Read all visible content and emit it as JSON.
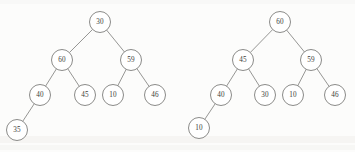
{
  "figure": {
    "node_radius": 10.5,
    "colors": {
      "background": "#fcfcfb",
      "node_fill": "#ffffff",
      "node_stroke": "#7e7e7c",
      "edge_stroke": "#8a8a88",
      "label_text": "#3a3a39"
    }
  },
  "trees": [
    {
      "name": "left-tree",
      "root_label": "30",
      "nodes": [
        {
          "id": "l0",
          "label": "30",
          "cx": 100,
          "cy": 22
        },
        {
          "id": "l1",
          "label": "60",
          "cx": 62,
          "cy": 60
        },
        {
          "id": "l2",
          "label": "59",
          "cx": 131,
          "cy": 60
        },
        {
          "id": "l3",
          "label": "40",
          "cx": 40,
          "cy": 95
        },
        {
          "id": "l4",
          "label": "45",
          "cx": 85,
          "cy": 95
        },
        {
          "id": "l5",
          "label": "10",
          "cx": 113,
          "cy": 95
        },
        {
          "id": "l6",
          "label": "46",
          "cx": 155,
          "cy": 95
        },
        {
          "id": "l7",
          "label": "35",
          "cx": 17,
          "cy": 130
        }
      ],
      "edges": [
        {
          "from": "l0",
          "to": "l1"
        },
        {
          "from": "l0",
          "to": "l2"
        },
        {
          "from": "l1",
          "to": "l3"
        },
        {
          "from": "l1",
          "to": "l4"
        },
        {
          "from": "l2",
          "to": "l5"
        },
        {
          "from": "l2",
          "to": "l6"
        },
        {
          "from": "l3",
          "to": "l7"
        }
      ]
    },
    {
      "name": "right-tree",
      "root_label": "60",
      "nodes": [
        {
          "id": "r0",
          "label": "60",
          "cx": 280,
          "cy": 22
        },
        {
          "id": "r1",
          "label": "45",
          "cx": 243,
          "cy": 60
        },
        {
          "id": "r2",
          "label": "59",
          "cx": 311,
          "cy": 60
        },
        {
          "id": "r3",
          "label": "40",
          "cx": 221,
          "cy": 95
        },
        {
          "id": "r4",
          "label": "30",
          "cx": 265,
          "cy": 95
        },
        {
          "id": "r5",
          "label": "10",
          "cx": 293,
          "cy": 95
        },
        {
          "id": "r6",
          "label": "46",
          "cx": 335,
          "cy": 95
        },
        {
          "id": "r7",
          "label": "10",
          "cx": 199,
          "cy": 128
        }
      ],
      "edges": [
        {
          "from": "r0",
          "to": "r1"
        },
        {
          "from": "r0",
          "to": "r2"
        },
        {
          "from": "r1",
          "to": "r3"
        },
        {
          "from": "r1",
          "to": "r4"
        },
        {
          "from": "r2",
          "to": "r5"
        },
        {
          "from": "r2",
          "to": "r6"
        },
        {
          "from": "r3",
          "to": "r7"
        }
      ]
    }
  ]
}
